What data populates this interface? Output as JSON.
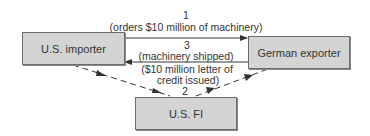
{
  "diagram": {
    "nodes": {
      "importer": {
        "label": "U.S. importer"
      },
      "exporter": {
        "label": "German exporter"
      },
      "fi": {
        "label": "U.S. FI"
      }
    },
    "edges": {
      "step1": {
        "number": "1",
        "text": "(orders $10 million of machinery)",
        "style": "solid",
        "from": "U.S. importer",
        "to": "German exporter"
      },
      "step2": {
        "number": "2",
        "text_line1": "($10 million letter of",
        "text_line2": "credit issued)",
        "style": "dashed",
        "from": "U.S. importer",
        "via": "U.S. FI",
        "to": "German exporter"
      },
      "step3": {
        "number": "3",
        "text": "(machinery shipped)",
        "style": "solid",
        "from": "German exporter",
        "to": "U.S. importer"
      }
    },
    "colors": {
      "box_fill": "#d4d4d4",
      "box_border": "#6b6b6b",
      "line": "#333333"
    }
  }
}
